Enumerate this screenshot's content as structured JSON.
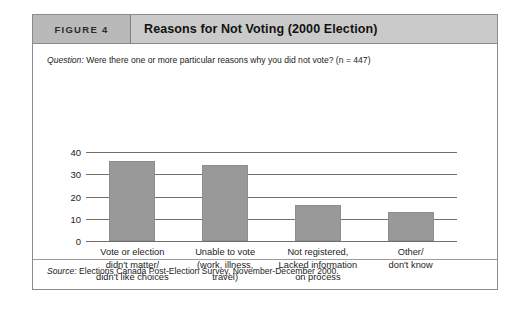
{
  "figure": {
    "number_label": "FIGURE 4",
    "title": "Reasons for Not Voting (2000 Election)",
    "question_label": "Question:",
    "question_text": " Were there one or more particular reasons why you did not vote? (n = 447)",
    "source_label": "Source:",
    "source_text": " Elections Canada Post-Election Survey, November-December 2000.",
    "colors": {
      "bar_fill": "#999999",
      "header_number_bg": "#b9b9b9",
      "header_title_bg": "#cacaca",
      "frame_border": "#8a8a8a",
      "axis_line": "#6f6f6f"
    }
  },
  "chart_data": {
    "type": "bar",
    "title": "Reasons for Not Voting (2000 Election)",
    "xlabel": "",
    "ylabel": "",
    "ylim": [
      0,
      40
    ],
    "yticks": [
      0,
      10,
      20,
      30,
      40
    ],
    "ytick_labels": [
      "0",
      "10",
      "20",
      "30",
      "40"
    ],
    "grid": true,
    "legend": "none",
    "categories": [
      "Vote or election didn't matter/ didn't like choices",
      "Unable to vote (work, illness, travel)",
      "Not registered, Lacked information on process",
      "Other/ don't know"
    ],
    "category_lines": [
      [
        "Vote or election",
        "didn't matter/",
        "didn't like choices"
      ],
      [
        "Unable to vote",
        "(work, illness,",
        "travel)"
      ],
      [
        "Not registered,",
        "Lacked information",
        "on process"
      ],
      [
        "Other/",
        "don't know"
      ]
    ],
    "values": [
      36,
      34,
      16,
      13
    ]
  }
}
